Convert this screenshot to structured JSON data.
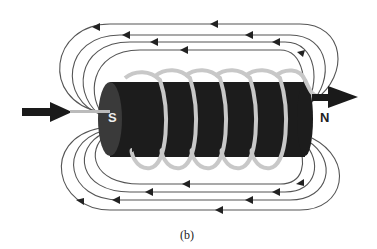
{
  "figure": {
    "caption": "(b)",
    "poles": {
      "south": "S",
      "north": "N"
    },
    "field_lines": {
      "above": 4,
      "below": 4,
      "direction_outside": "N-to-S (right-to-left)"
    },
    "coil_turns": 6,
    "current_arrows": [
      "input-left",
      "output-right"
    ],
    "colors": {
      "core": "#1c1c1c",
      "coil": "#bdbdbd",
      "lines": "#555555",
      "background": "#ffffff"
    }
  }
}
